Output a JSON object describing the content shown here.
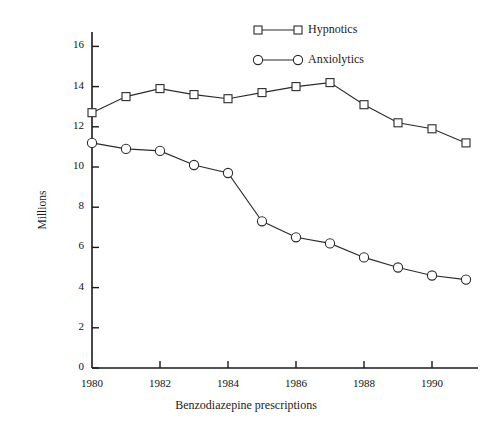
{
  "chart_data": {
    "type": "line",
    "title": "",
    "xlabel": "Benzodiazepine prescriptions",
    "ylabel": "Millions",
    "x": [
      1980,
      1981,
      1982,
      1983,
      1984,
      1985,
      1986,
      1987,
      1988,
      1989,
      1990,
      1991
    ],
    "xlim": [
      1980,
      1991
    ],
    "ylim": [
      0,
      17
    ],
    "xticks": [
      1980,
      1982,
      1984,
      1986,
      1988,
      1990
    ],
    "xticklabels": [
      "1980",
      "1982",
      "1984",
      "1986",
      "1988",
      "1990"
    ],
    "yticks": [
      0,
      2,
      4,
      6,
      8,
      10,
      12,
      14,
      16
    ],
    "yticklabels": [
      "0",
      "2",
      "4",
      "6",
      "8",
      "10",
      "12",
      "14",
      "16"
    ],
    "grid": false,
    "legend_position": "top-center",
    "series": [
      {
        "name": "Hypnotics",
        "marker": "square",
        "values": [
          12.7,
          13.5,
          13.9,
          13.6,
          13.4,
          13.7,
          14.0,
          14.2,
          13.1,
          12.2,
          11.9,
          11.2
        ]
      },
      {
        "name": "Anxiolytics",
        "marker": "circle",
        "values": [
          11.2,
          10.9,
          10.8,
          10.1,
          9.7,
          7.3,
          6.5,
          6.2,
          5.5,
          5.0,
          4.6,
          4.4
        ]
      }
    ]
  },
  "legend": {
    "items": [
      {
        "label": "Hypnotics",
        "marker": "square-marker"
      },
      {
        "label": "Anxiolytics",
        "marker": "circle-marker"
      }
    ]
  },
  "axes": {
    "y_title": "Millions",
    "x_title": "Benzodiazepine prescriptions"
  },
  "colors": {
    "line": "#2b2b2b",
    "marker_fill": "#ffffff",
    "axis": "#1a1a1a",
    "background": "#ffffff"
  }
}
